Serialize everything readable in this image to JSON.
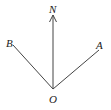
{
  "diagram": {
    "type": "direction-angle-diagram",
    "colors": {
      "background": "#ffffff",
      "line": "#444444",
      "text": "#222222"
    },
    "origin": {
      "label": "O",
      "x": 53,
      "y": 89
    },
    "rays": [
      {
        "id": "north",
        "label": "N",
        "x2": 53,
        "y2": 17,
        "arrow": true
      },
      {
        "id": "B",
        "label": "B",
        "x2": 13,
        "y2": 45,
        "arrow": false
      },
      {
        "id": "A",
        "label": "A",
        "x2": 99,
        "y2": 50,
        "arrow": false
      }
    ]
  }
}
